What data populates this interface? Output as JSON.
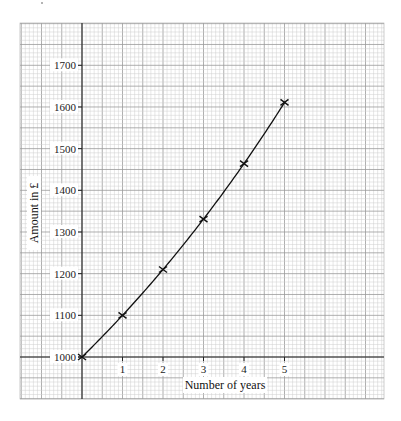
{
  "chart_data": {
    "type": "line",
    "title": "",
    "xlabel": "Number of years",
    "ylabel": "Amount in £",
    "x": [
      0,
      1,
      2,
      3,
      4,
      5
    ],
    "series": [
      {
        "name": "Amount",
        "values": [
          1000,
          1100,
          1210,
          1331,
          1464,
          1611
        ],
        "marker": "x",
        "smooth": true
      }
    ],
    "x_ticks": [
      "1",
      "2",
      "3",
      "4",
      "5"
    ],
    "y_ticks": [
      "1000",
      "1100",
      "1200",
      "1300",
      "1400",
      "1500",
      "1600",
      "1700"
    ],
    "xlim": [
      -1.5,
      7.5
    ],
    "ylim": [
      900,
      1780
    ],
    "grid": true,
    "legend": null
  }
}
